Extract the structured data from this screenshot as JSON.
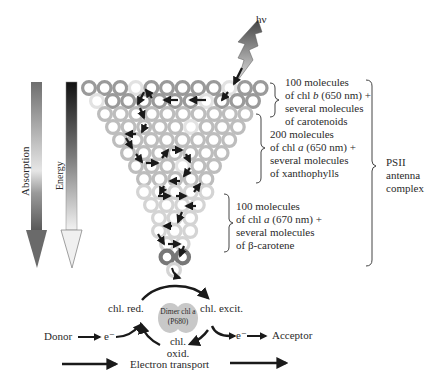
{
  "photon": {
    "label": "hν"
  },
  "left_arrows": {
    "absorption": {
      "label": "Absorption"
    },
    "energy": {
      "label": "Energy"
    }
  },
  "antenna_groups": [
    {
      "id": "chl-b",
      "lines": [
        "100 molecules",
        "of chl b (650 nm) +",
        "several molecules",
        "of carotenoids"
      ]
    },
    {
      "id": "chl-a-650",
      "lines": [
        "200 molecules",
        "of chl a (650 nm) +",
        "several molecules",
        "of xanthophylls"
      ]
    },
    {
      "id": "chl-a-670",
      "lines": [
        "100 molecules",
        "of chl a (670 nm) +",
        "several molecules",
        "of β-carotene"
      ]
    }
  ],
  "complex": {
    "lines": [
      "PSII",
      "antenna",
      "complex"
    ]
  },
  "reaction_center": {
    "dimer_lines": [
      "Dimer chl a",
      "(P680)"
    ],
    "chl_red": "chl. red.",
    "chl_excit": "chl. excit.",
    "chl_oxid_lines": [
      "chl.",
      "oxid."
    ]
  },
  "electron_flow": {
    "donor": "Donor",
    "acceptor": "Acceptor",
    "electron_in": "e⁻",
    "electron_out": "e⁻",
    "legend": "Electron transport"
  },
  "colors": {
    "ring_dark": "#9a9a9a",
    "ring_light": "#d4d4d4",
    "ring_reaction": "#777777",
    "arrow": "#1a1a1a",
    "dimer_fill": "#c8c8c8"
  }
}
